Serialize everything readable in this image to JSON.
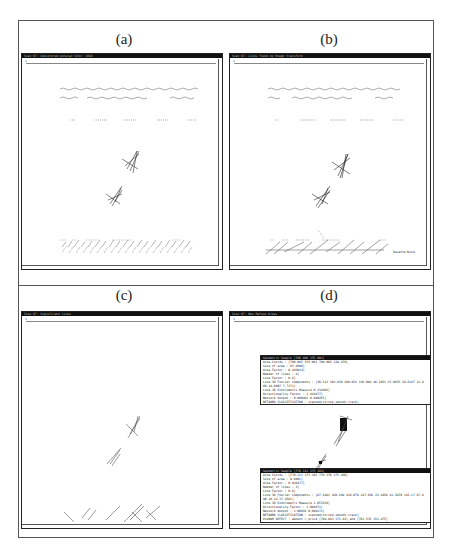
{
  "figure": {
    "panels": [
      {
        "id": "a",
        "label": "(a)",
        "window_title": "Scan 07: Cemiotored ponstat Shox: 1048",
        "ruler_label": "1",
        "description": "scanned document with handwritten text rows, two hatched line clusters, and dense hatched block at bottom"
      },
      {
        "id": "b",
        "label": "(b)",
        "window_title": "Scan 07: Lines found by Hough transform",
        "ruler_label": "1",
        "annotation": "Baseline Noise"
      },
      {
        "id": "c",
        "label": "(c)",
        "window_title": "Scan 07: Significant Lines",
        "ruler_label": "1"
      },
      {
        "id": "d",
        "label": "(d)",
        "window_title": "Scan 07: New Refuse Areas",
        "ruler_label": "1",
        "info_boxes": [
          {
            "title": "Geometric Sample [700 806 155 001]",
            "lines": [
              "Area Coords : [700.005 155.001 780.003 138.479]",
              "Size of area : 65.4696]",
              "Area Factor : 0.443014]",
              "Number of lines : 4]",
              "Line Factor : 0.6]",
              "Line 3D Fourier Components : [30.512 303.830 280.023 136.004 46.2953 25.0855 38.6147 13.8",
              "60 44.6007 7.7171]",
              "Line 3D Eiholometri Measure 0.232802]",
              "Directionality Factor : 1.428877]",
              "Network Output : 0.000461 0.999455]",
              "NETWORK CLASSIFICATION : scanned/strike_smooth.crack]"
            ]
          },
          {
            "title": "Geometric Sample [770 211 175 183]",
            "lines": [
              "Area Coords : [770.211 175.185 770.370 175.186]",
              "Size of area : 9.0401]",
              "Area Factor : 0.938477]",
              "Number of lines : 3]",
              "Line Factor : 0.6]",
              "Line 3D Fourier Components : [87.4481 420.294 416.078 147.916 23.4458 41.3879 143.17 87.8",
              "90 16.14 17.4581]",
              "Line 3D Eiholometri Measure 1.057858]",
              "Directionality Factor : 1.094671]",
              "Network Output : 1.00016 0.998171]",
              "NETWORK CLASSIFICATION : scanned/strike_smooth.crack]",
              "PLANAR DEFECT : amount = price [798.943 171.83] and [761.576 153.475]"
            ]
          }
        ]
      }
    ]
  }
}
